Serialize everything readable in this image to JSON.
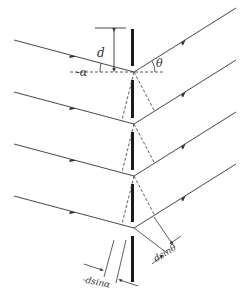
{
  "diagram": {
    "labels": {
      "d": "d",
      "alpha": "-α",
      "theta": "θ",
      "dsin_alpha": "-dsinα",
      "dsin_theta": "dsinθ"
    },
    "colors": {
      "line": "#333333",
      "slit": "#1a1a1a",
      "background": "#ffffff"
    },
    "junctions": [
      {
        "x": 134,
        "y": 72
      },
      {
        "x": 134,
        "y": 124
      },
      {
        "x": 134,
        "y": 176
      },
      {
        "x": 134,
        "y": 228
      }
    ],
    "slit_bars": [
      {
        "y1": 29,
        "y2": 66
      },
      {
        "y1": 80,
        "y2": 118
      },
      {
        "y1": 132,
        "y2": 170
      },
      {
        "y1": 184,
        "y2": 222
      },
      {
        "y1": 236,
        "y2": 282
      }
    ]
  }
}
